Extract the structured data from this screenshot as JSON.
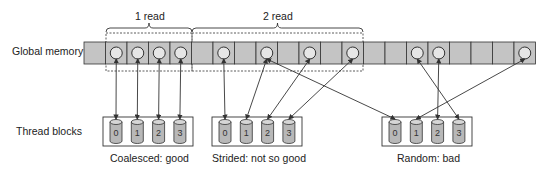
{
  "labels": {
    "global_memory": "Global memory",
    "thread_blocks": "Thread blocks",
    "read1": "1 read",
    "read2": "2 read"
  },
  "memory": {
    "cell_count": 21,
    "occupied_cells": [
      1,
      2,
      3,
      4,
      6,
      8,
      10,
      12,
      15,
      16,
      20
    ]
  },
  "blocks": [
    {
      "caption": "Coalesced: good",
      "threads": [
        "0",
        "1",
        "2",
        "3"
      ],
      "sources": [
        1,
        2,
        3,
        4
      ]
    },
    {
      "caption": "Strided: not so good",
      "threads": [
        "0",
        "1",
        "2",
        "3"
      ],
      "sources": [
        6,
        8,
        10,
        12
      ]
    },
    {
      "caption": "Random: bad",
      "threads": [
        "0",
        "1",
        "2",
        "3"
      ],
      "sources": [
        8,
        20,
        16,
        15
      ]
    }
  ],
  "colors": {
    "cell_fill": "#c4c4c4",
    "stroke": "#333333",
    "circle_fill": "#e6e6e6",
    "cylinder_fill": "#b8b8b8",
    "cylinder_top": "#d6d6d6"
  }
}
